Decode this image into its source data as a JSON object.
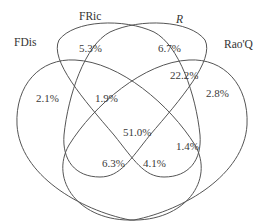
{
  "diagram": {
    "type": "venn-4-set",
    "sets": [
      {
        "id": "fdis",
        "label": "FDis"
      },
      {
        "id": "fric",
        "label": "FRic"
      },
      {
        "id": "r",
        "label": "R"
      },
      {
        "id": "raoq",
        "label": "Rao'Q"
      }
    ],
    "regions": {
      "fdis_only": "2.1%",
      "fric_only": "5.3%",
      "r_only": "6.7%",
      "raoq_only": "2.8%",
      "fdis_fric": "1.9%",
      "r_raoq": "22.2%",
      "all_four": "51.0%",
      "fdis_fric_r": "6.3%",
      "fric_r_raoq": "4.1%",
      "fric_raoq": "1.4%"
    },
    "stroke_color": "#555555"
  }
}
